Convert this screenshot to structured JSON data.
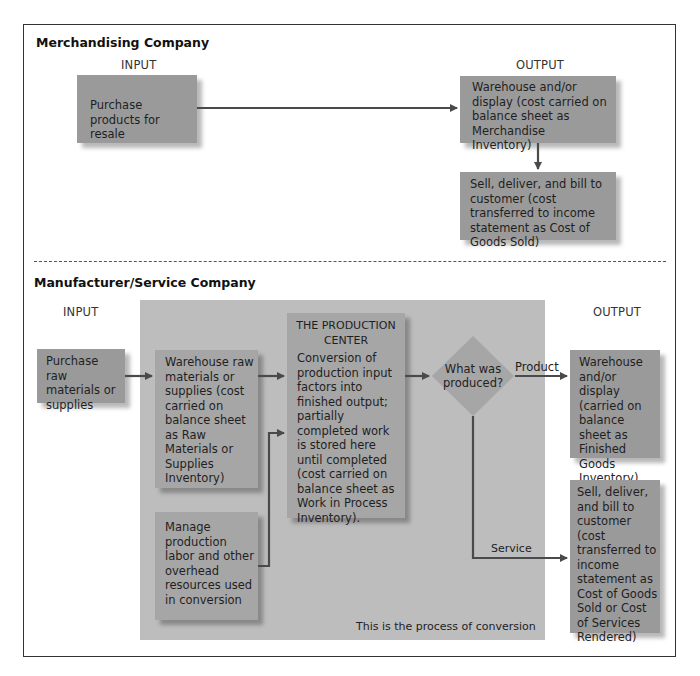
{
  "merchandising": {
    "title": "Merchandising Company",
    "input_label": "INPUT",
    "output_label": "OUTPUT",
    "purchase_box": "Purchase products for resale",
    "warehouse_box": "Warehouse and/or display (cost carried on balance sheet as Merchandise Inventory)",
    "sell_box": "Sell, deliver, and bill to customer (cost transferred to income statement as Cost of Goods Sold)"
  },
  "manufacturer": {
    "title": "Manufacturer/Service Company",
    "input_label": "INPUT",
    "output_label": "OUTPUT",
    "purchase_box": "Purchase raw materials or supplies",
    "warehouse_raw_box": "Warehouse raw materials or supplies (cost carried on balance sheet as Raw Materials or Supplies Inventory)",
    "manage_box": "Manage production labor and other overhead resources used in conversion",
    "production_center": {
      "title": "THE PRODUCTION CENTER",
      "body": "Conversion of production input factors into finished output; partially completed work is stored here until completed (cost carried on balance sheet as Work in Process Inventory)."
    },
    "decision": "What was produced?",
    "product_label": "Product",
    "service_label": "Service",
    "finished_goods_box": "Warehouse and/or display (carried on balance sheet as Finished Goods Inventory)",
    "sell_box": "Sell, deliver, and bill to customer (cost transferred to income statement as Cost of Goods Sold or Cost of Services Rendered)",
    "panel_caption": "This is the process of conversion"
  },
  "colors": {
    "box": "#9a9a9a",
    "panel": "#bdbdbd",
    "arrow": "#4a4a4a",
    "frame": "#333333"
  }
}
